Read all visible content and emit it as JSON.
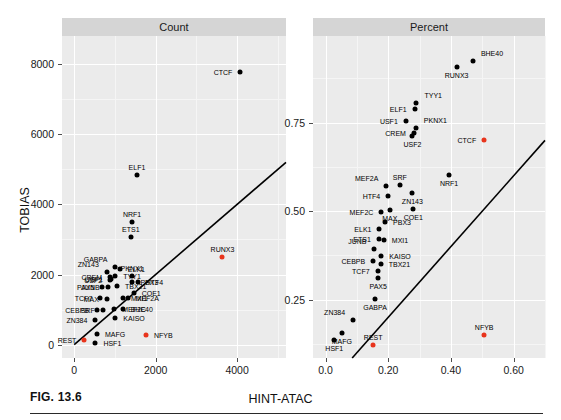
{
  "figure": {
    "caption": "FIG. 13.6",
    "xlabel": "HINT-ATAC",
    "ylabel": "TOBIAS"
  },
  "panels": [
    {
      "strip_label": "Count"
    },
    {
      "strip_label": "Percent"
    }
  ],
  "colors": {
    "panel_background": "#ebebeb",
    "strip_background": "#d5d5d5",
    "gridline": "#ffffff",
    "point": "#000000",
    "highlight_point": "#e8341c",
    "line": "#000000"
  },
  "chart_data": [
    {
      "type": "scatter",
      "title": "Count",
      "xlabel": "HINT-ATAC",
      "ylabel": "TOBIAS",
      "xlim": [
        -300,
        5200
      ],
      "ylim": [
        -380,
        8800
      ],
      "xticks": [
        0,
        2000,
        4000
      ],
      "yticks": [
        0,
        2000,
        4000,
        6000,
        8000
      ],
      "grid": true,
      "legend": "none",
      "reference_line": {
        "type": "identity",
        "x": [
          0,
          5200
        ],
        "y": [
          0,
          5200
        ]
      },
      "points": [
        {
          "label": "CTCF",
          "x": 4080,
          "y": 7780,
          "color": "black",
          "label_pos": "left"
        },
        {
          "label": "ELF1",
          "x": 1540,
          "y": 4840,
          "color": "black",
          "label_pos": "above"
        },
        {
          "label": "NRF1",
          "x": 1420,
          "y": 3490,
          "color": "black",
          "label_pos": "above"
        },
        {
          "label": "ETS1",
          "x": 1390,
          "y": 3080,
          "color": "black",
          "label_pos": "above"
        },
        {
          "label": "RUNX3",
          "x": 3640,
          "y": 2500,
          "color": "red",
          "label_pos": "above"
        },
        {
          "label": "GABPA",
          "x": 1010,
          "y": 2220,
          "color": "black",
          "label_pos": "upleft"
        },
        {
          "label": "ELK1",
          "x": 1120,
          "y": 2150,
          "color": "black",
          "label_pos": "right"
        },
        {
          "label": "ZN143",
          "x": 800,
          "y": 2080,
          "color": "black",
          "label_pos": "upleft"
        },
        {
          "label": "TYY1",
          "x": 1010,
          "y": 1960,
          "color": "black",
          "label_pos": "right"
        },
        {
          "label": "CREM",
          "x": 880,
          "y": 1930,
          "color": "black",
          "label_pos": "left"
        },
        {
          "label": "PKNX1",
          "x": 1420,
          "y": 1960,
          "color": "black",
          "label_pos": "above"
        },
        {
          "label": "USF1",
          "x": 900,
          "y": 1860,
          "color": "black",
          "label_pos": "left"
        },
        {
          "label": "USF2",
          "x": 880,
          "y": 1840,
          "color": "black",
          "label_pos": "left"
        },
        {
          "label": "HTF4",
          "x": 1560,
          "y": 1790,
          "color": "black",
          "label_pos": "right"
        },
        {
          "label": "PBX3",
          "x": 1430,
          "y": 1790,
          "color": "black",
          "label_pos": "right"
        },
        {
          "label": "TBX21",
          "x": 1050,
          "y": 1660,
          "color": "black",
          "label_pos": "right"
        },
        {
          "label": "PAX5",
          "x": 690,
          "y": 1640,
          "color": "black",
          "label_pos": "left"
        },
        {
          "label": "JUNB",
          "x": 820,
          "y": 1640,
          "color": "black",
          "label_pos": "left"
        },
        {
          "label": "COE1",
          "x": 1460,
          "y": 1480,
          "color": "black",
          "label_pos": "right"
        },
        {
          "label": "MXI1",
          "x": 1200,
          "y": 1340,
          "color": "black",
          "label_pos": "right"
        },
        {
          "label": "MEF2A",
          "x": 1310,
          "y": 1320,
          "color": "black",
          "label_pos": "right"
        },
        {
          "label": "TCF7",
          "x": 640,
          "y": 1340,
          "color": "black",
          "label_pos": "left"
        },
        {
          "label": "MAX",
          "x": 800,
          "y": 1300,
          "color": "black",
          "label_pos": "left"
        },
        {
          "label": "MEF2C",
          "x": 980,
          "y": 1030,
          "color": "black",
          "label_pos": "right"
        },
        {
          "label": "BHE40",
          "x": 1190,
          "y": 1010,
          "color": "black",
          "label_pos": "right"
        },
        {
          "label": "CEBPB",
          "x": 560,
          "y": 1000,
          "color": "black",
          "label_pos": "left"
        },
        {
          "label": "SRF",
          "x": 700,
          "y": 1000,
          "color": "black",
          "label_pos": "left"
        },
        {
          "label": "KAISO",
          "x": 1010,
          "y": 760,
          "color": "black",
          "label_pos": "right"
        },
        {
          "label": "ZN384",
          "x": 520,
          "y": 700,
          "color": "black",
          "label_pos": "left"
        },
        {
          "label": "MAFG",
          "x": 560,
          "y": 300,
          "color": "black",
          "label_pos": "right"
        },
        {
          "label": "NFYB",
          "x": 1760,
          "y": 270,
          "color": "red",
          "label_pos": "right"
        },
        {
          "label": "REST",
          "x": 250,
          "y": 120,
          "color": "red",
          "label_pos": "left"
        },
        {
          "label": "HSF1",
          "x": 520,
          "y": 60,
          "color": "black",
          "label_pos": "right"
        }
      ]
    },
    {
      "type": "scatter",
      "title": "Percent",
      "xlabel": "HINT-ATAC",
      "ylabel": "TOBIAS",
      "xlim": [
        -0.04,
        0.7
      ],
      "ylim": [
        0.085,
        0.995
      ],
      "xticks": [
        0.0,
        0.2,
        0.4,
        0.6
      ],
      "yticks": [
        0.25,
        0.5,
        0.75
      ],
      "grid": true,
      "legend": "none",
      "reference_line": {
        "type": "identity",
        "x": [
          0.085,
          0.7
        ],
        "y": [
          0.085,
          0.7
        ]
      },
      "points": [
        {
          "label": "BHE40",
          "x": 0.47,
          "y": 0.925,
          "color": "black",
          "label_pos": "upright"
        },
        {
          "label": "RUNX3",
          "x": 0.418,
          "y": 0.906,
          "color": "black",
          "label_pos": "below"
        },
        {
          "label": "TYY1",
          "x": 0.29,
          "y": 0.806,
          "color": "black",
          "label_pos": "upright"
        },
        {
          "label": "ELF1",
          "x": 0.284,
          "y": 0.79,
          "color": "black",
          "label_pos": "left"
        },
        {
          "label": "USF1",
          "x": 0.256,
          "y": 0.754,
          "color": "black",
          "label_pos": "left"
        },
        {
          "label": "PKNX1",
          "x": 0.288,
          "y": 0.735,
          "color": "black",
          "label_pos": "upright"
        },
        {
          "label": "CREM",
          "x": 0.282,
          "y": 0.722,
          "color": "black",
          "label_pos": "left"
        },
        {
          "label": "USF2",
          "x": 0.277,
          "y": 0.712,
          "color": "black",
          "label_pos": "below"
        },
        {
          "label": "CTCF",
          "x": 0.506,
          "y": 0.7,
          "color": "red",
          "label_pos": "left"
        },
        {
          "label": "NRF1",
          "x": 0.394,
          "y": 0.602,
          "color": "black",
          "label_pos": "below"
        },
        {
          "label": "MEF2A",
          "x": 0.194,
          "y": 0.572,
          "color": "black",
          "label_pos": "upleft"
        },
        {
          "label": "SRF",
          "x": 0.237,
          "y": 0.574,
          "color": "black",
          "label_pos": "above"
        },
        {
          "label": "ZN143",
          "x": 0.277,
          "y": 0.55,
          "color": "black",
          "label_pos": "below"
        },
        {
          "label": "HTF4",
          "x": 0.2,
          "y": 0.542,
          "color": "black",
          "label_pos": "left"
        },
        {
          "label": "MAX",
          "x": 0.205,
          "y": 0.503,
          "color": "black",
          "label_pos": "below"
        },
        {
          "label": "COE1",
          "x": 0.28,
          "y": 0.507,
          "color": "black",
          "label_pos": "below"
        },
        {
          "label": "MEF2C",
          "x": 0.178,
          "y": 0.497,
          "color": "black",
          "label_pos": "left"
        },
        {
          "label": "PBX3",
          "x": 0.19,
          "y": 0.47,
          "color": "black",
          "label_pos": "right"
        },
        {
          "label": "ELK1",
          "x": 0.172,
          "y": 0.449,
          "color": "black",
          "label_pos": "left"
        },
        {
          "label": "ETS1",
          "x": 0.17,
          "y": 0.422,
          "color": "black",
          "label_pos": "left"
        },
        {
          "label": "MXI1",
          "x": 0.186,
          "y": 0.419,
          "color": "black",
          "label_pos": "right"
        },
        {
          "label": "JUNB",
          "x": 0.156,
          "y": 0.392,
          "color": "black",
          "label_pos": "upleft"
        },
        {
          "label": "KAISO",
          "x": 0.178,
          "y": 0.374,
          "color": "black",
          "label_pos": "right"
        },
        {
          "label": "CEBPB",
          "x": 0.152,
          "y": 0.36,
          "color": "black",
          "label_pos": "left"
        },
        {
          "label": "TBX21",
          "x": 0.176,
          "y": 0.35,
          "color": "black",
          "label_pos": "right"
        },
        {
          "label": "TCF7",
          "x": 0.166,
          "y": 0.33,
          "color": "black",
          "label_pos": "left"
        },
        {
          "label": "PAX5",
          "x": 0.168,
          "y": 0.31,
          "color": "black",
          "label_pos": "below"
        },
        {
          "label": "GABPA",
          "x": 0.158,
          "y": 0.252,
          "color": "black",
          "label_pos": "below"
        },
        {
          "label": "ZN384",
          "x": 0.088,
          "y": 0.193,
          "color": "black",
          "label_pos": "upleft"
        },
        {
          "label": "MAFG",
          "x": 0.052,
          "y": 0.157,
          "color": "black",
          "label_pos": "below"
        },
        {
          "label": "NFYB",
          "x": 0.506,
          "y": 0.15,
          "color": "red",
          "label_pos": "above"
        },
        {
          "label": "HSF1",
          "x": 0.028,
          "y": 0.137,
          "color": "black",
          "label_pos": "below"
        },
        {
          "label": "REST",
          "x": 0.152,
          "y": 0.123,
          "color": "red",
          "label_pos": "above"
        }
      ]
    }
  ]
}
